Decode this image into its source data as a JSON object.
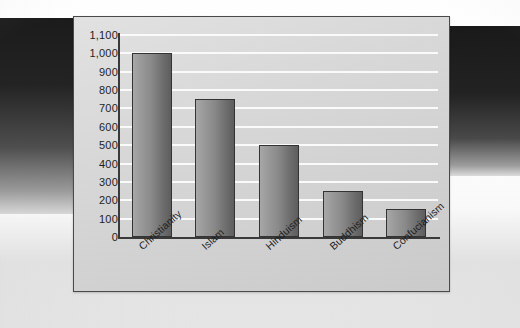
{
  "chart_data": {
    "type": "bar",
    "title": "",
    "subtitle": "",
    "xlabel": "",
    "ylabel": "",
    "categories": [
      "Christianity",
      "Islam",
      "Hinduism",
      "Buddhism",
      "Confucianism"
    ],
    "values": [
      1000,
      750,
      500,
      250,
      150
    ],
    "ylim": [
      0,
      1100
    ],
    "ytick_step": 100,
    "ytick_labels": [
      "1,100",
      "1,000",
      "900",
      "800",
      "700",
      "600",
      "500",
      "400",
      "300",
      "200",
      "100",
      "0"
    ],
    "ytick_values": [
      1100,
      1000,
      900,
      800,
      700,
      600,
      500,
      400,
      300,
      200,
      100,
      0
    ],
    "grid": true,
    "grid_orientation": "horizontal",
    "legend": false,
    "legend_position": "none",
    "x_tick_label_rotation": -42,
    "colors": {
      "panel_background": "#d6d6d6",
      "panel_border": "#4a4a4a",
      "gridline": "#fbfbfb",
      "axis": "#3a3a3a",
      "bar_fill_light": "#a8a8a8",
      "bar_fill_dark": "#5e5e5e",
      "bar_border": "#343434",
      "tick_text": "#1f1f1f",
      "page_background": "#fdfdfd"
    }
  }
}
